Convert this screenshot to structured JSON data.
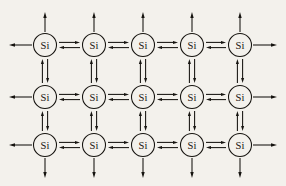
{
  "diagram": {
    "kind": "lattice-equilibrium-diagram",
    "background_color": "#f3f1ec",
    "ink_color": "#15130f",
    "node_label": "Si",
    "node_count": 15,
    "grid": {
      "rows": 3,
      "columns": 5,
      "column_centers_px": [
        45,
        94,
        143,
        192,
        240
      ],
      "row_centers_px": [
        45,
        97,
        145
      ],
      "node_radius_px": 11.5
    },
    "nodes": [
      {
        "id": "si-r1c1",
        "label": "Si",
        "row": 1,
        "col": 1,
        "cx": 45,
        "cy": 45
      },
      {
        "id": "si-r1c2",
        "label": "Si",
        "row": 1,
        "col": 2,
        "cx": 94,
        "cy": 45
      },
      {
        "id": "si-r1c3",
        "label": "Si",
        "row": 1,
        "col": 3,
        "cx": 143,
        "cy": 45
      },
      {
        "id": "si-r1c4",
        "label": "Si",
        "row": 1,
        "col": 4,
        "cx": 192,
        "cy": 45
      },
      {
        "id": "si-r1c5",
        "label": "Si",
        "row": 1,
        "col": 5,
        "cx": 240,
        "cy": 45
      },
      {
        "id": "si-r2c1",
        "label": "Si",
        "row": 2,
        "col": 1,
        "cx": 45,
        "cy": 97
      },
      {
        "id": "si-r2c2",
        "label": "Si",
        "row": 2,
        "col": 2,
        "cx": 94,
        "cy": 97
      },
      {
        "id": "si-r2c3",
        "label": "Si",
        "row": 2,
        "col": 3,
        "cx": 143,
        "cy": 97
      },
      {
        "id": "si-r2c4",
        "label": "Si",
        "row": 2,
        "col": 4,
        "cx": 192,
        "cy": 97
      },
      {
        "id": "si-r2c5",
        "label": "Si",
        "row": 2,
        "col": 5,
        "cx": 240,
        "cy": 97
      },
      {
        "id": "si-r3c1",
        "label": "Si",
        "row": 3,
        "col": 1,
        "cx": 45,
        "cy": 145
      },
      {
        "id": "si-r3c2",
        "label": "Si",
        "row": 3,
        "col": 2,
        "cx": 94,
        "cy": 145
      },
      {
        "id": "si-r3c3",
        "label": "Si",
        "row": 3,
        "col": 3,
        "cx": 143,
        "cy": 145
      },
      {
        "id": "si-r3c4",
        "label": "Si",
        "row": 3,
        "col": 4,
        "cx": 192,
        "cy": 145
      },
      {
        "id": "si-r3c5",
        "label": "Si",
        "row": 3,
        "col": 5,
        "cx": 240,
        "cy": 145
      }
    ],
    "horizontal_equilibrium_bonds": [
      {
        "id": "eq-h-r1c1-c2",
        "row": 1,
        "from_col": 1,
        "to_col": 2,
        "symbol": "equilibrium-horizontal"
      },
      {
        "id": "eq-h-r1c2-c3",
        "row": 1,
        "from_col": 2,
        "to_col": 3,
        "symbol": "equilibrium-horizontal"
      },
      {
        "id": "eq-h-r1c3-c4",
        "row": 1,
        "from_col": 3,
        "to_col": 4,
        "symbol": "equilibrium-horizontal"
      },
      {
        "id": "eq-h-r1c4-c5",
        "row": 1,
        "from_col": 4,
        "to_col": 5,
        "symbol": "equilibrium-horizontal"
      },
      {
        "id": "eq-h-r2c1-c2",
        "row": 2,
        "from_col": 1,
        "to_col": 2,
        "symbol": "equilibrium-horizontal"
      },
      {
        "id": "eq-h-r2c2-c3",
        "row": 2,
        "from_col": 2,
        "to_col": 3,
        "symbol": "equilibrium-horizontal"
      },
      {
        "id": "eq-h-r2c3-c4",
        "row": 2,
        "from_col": 3,
        "to_col": 4,
        "symbol": "equilibrium-horizontal"
      },
      {
        "id": "eq-h-r2c4-c5",
        "row": 2,
        "from_col": 4,
        "to_col": 5,
        "symbol": "equilibrium-horizontal"
      },
      {
        "id": "eq-h-r3c1-c2",
        "row": 3,
        "from_col": 1,
        "to_col": 2,
        "symbol": "equilibrium-horizontal"
      },
      {
        "id": "eq-h-r3c2-c3",
        "row": 3,
        "from_col": 2,
        "to_col": 3,
        "symbol": "equilibrium-horizontal"
      },
      {
        "id": "eq-h-r3c3-c4",
        "row": 3,
        "from_col": 3,
        "to_col": 4,
        "symbol": "equilibrium-horizontal"
      },
      {
        "id": "eq-h-r3c4-c5",
        "row": 3,
        "from_col": 4,
        "to_col": 5,
        "symbol": "equilibrium-horizontal"
      }
    ],
    "vertical_equilibrium_bonds": [
      {
        "id": "eq-v-c1-r1r2",
        "col": 1,
        "from_row": 1,
        "to_row": 2,
        "symbol": "equilibrium-vertical"
      },
      {
        "id": "eq-v-c2-r1r2",
        "col": 2,
        "from_row": 1,
        "to_row": 2,
        "symbol": "equilibrium-vertical"
      },
      {
        "id": "eq-v-c3-r1r2",
        "col": 3,
        "from_row": 1,
        "to_row": 2,
        "symbol": "equilibrium-vertical"
      },
      {
        "id": "eq-v-c4-r1r2",
        "col": 4,
        "from_row": 1,
        "to_row": 2,
        "symbol": "equilibrium-vertical"
      },
      {
        "id": "eq-v-c5-r1r2",
        "col": 5,
        "from_row": 1,
        "to_row": 2,
        "symbol": "equilibrium-vertical"
      },
      {
        "id": "eq-v-c1-r2r3",
        "col": 1,
        "from_row": 2,
        "to_row": 3,
        "symbol": "equilibrium-vertical"
      },
      {
        "id": "eq-v-c2-r2r3",
        "col": 2,
        "from_row": 2,
        "to_row": 3,
        "symbol": "equilibrium-vertical"
      },
      {
        "id": "eq-v-c3-r2r3",
        "col": 3,
        "from_row": 2,
        "to_row": 3,
        "symbol": "equilibrium-vertical"
      },
      {
        "id": "eq-v-c4-r2r3",
        "col": 4,
        "from_row": 2,
        "to_row": 3,
        "symbol": "equilibrium-vertical"
      },
      {
        "id": "eq-v-c5-r2r3",
        "col": 5,
        "from_row": 2,
        "to_row": 3,
        "symbol": "equilibrium-vertical"
      }
    ],
    "edge_arrows": [
      {
        "id": "arrow-up-c1",
        "direction": "up",
        "col": 1,
        "x": 45,
        "from_y": 32,
        "to_y": 12
      },
      {
        "id": "arrow-up-c2",
        "direction": "up",
        "col": 2,
        "x": 94,
        "from_y": 32,
        "to_y": 12
      },
      {
        "id": "arrow-up-c3",
        "direction": "up",
        "col": 3,
        "x": 143,
        "from_y": 32,
        "to_y": 12
      },
      {
        "id": "arrow-up-c4",
        "direction": "up",
        "col": 4,
        "x": 192,
        "from_y": 32,
        "to_y": 12
      },
      {
        "id": "arrow-up-c5",
        "direction": "up",
        "col": 5,
        "x": 240,
        "from_y": 32,
        "to_y": 12
      },
      {
        "id": "arrow-down-c1",
        "direction": "down",
        "col": 1,
        "x": 45,
        "from_y": 158,
        "to_y": 178
      },
      {
        "id": "arrow-down-c2",
        "direction": "down",
        "col": 2,
        "x": 94,
        "from_y": 158,
        "to_y": 178
      },
      {
        "id": "arrow-down-c3",
        "direction": "down",
        "col": 3,
        "x": 143,
        "from_y": 158,
        "to_y": 178
      },
      {
        "id": "arrow-down-c4",
        "direction": "down",
        "col": 4,
        "x": 192,
        "from_y": 158,
        "to_y": 178
      },
      {
        "id": "arrow-down-c5",
        "direction": "down",
        "col": 5,
        "x": 240,
        "from_y": 158,
        "to_y": 178
      },
      {
        "id": "arrow-left-r1",
        "direction": "left",
        "row": 1,
        "y": 45,
        "from_x": 32,
        "to_x": 9
      },
      {
        "id": "arrow-left-r2",
        "direction": "left",
        "row": 2,
        "y": 97,
        "from_x": 32,
        "to_x": 9
      },
      {
        "id": "arrow-left-r3",
        "direction": "left",
        "row": 3,
        "y": 145,
        "from_x": 32,
        "to_x": 9
      },
      {
        "id": "arrow-right-r1",
        "direction": "right",
        "row": 1,
        "y": 45,
        "from_x": 253,
        "to_x": 277
      },
      {
        "id": "arrow-right-r2",
        "direction": "right",
        "row": 2,
        "y": 97,
        "from_x": 253,
        "to_x": 277
      },
      {
        "id": "arrow-right-r3",
        "direction": "right",
        "row": 3,
        "y": 145,
        "from_x": 253,
        "to_x": 277
      }
    ]
  }
}
